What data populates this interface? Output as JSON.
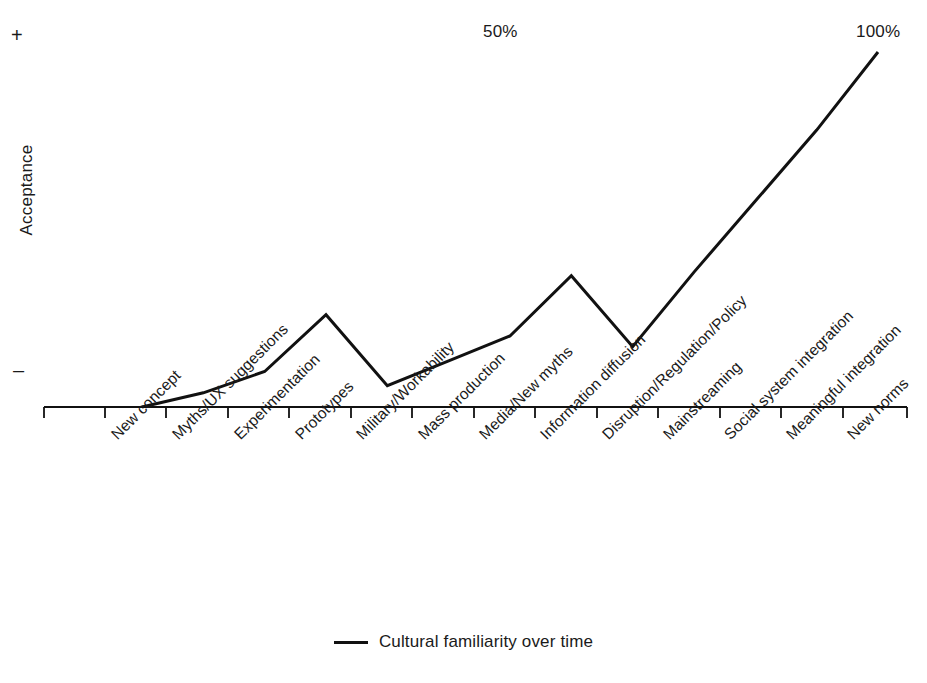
{
  "axis": {
    "y_title": "Acceptance",
    "y_high_marker": "+",
    "y_low_marker": "–"
  },
  "annotations": {
    "midpoint": "50%",
    "endpoint": "100%"
  },
  "legend": {
    "swatch": "line-swatch",
    "label": "Cultural familiarity over time"
  },
  "chart_data": {
    "type": "line",
    "title": "",
    "xlabel": "",
    "ylabel": "Acceptance",
    "grid": false,
    "legend_position": "bottom-center",
    "ylim": [
      0,
      100
    ],
    "ytick_labels": [
      "–",
      "+"
    ],
    "annotations": [
      {
        "text": "50%",
        "x_category": "Media/New myths",
        "position": "top"
      },
      {
        "text": "100%",
        "x_category": "New norms",
        "position": "top"
      }
    ],
    "categories": [
      "New concept",
      "Myths/UX suggestions",
      "Experimentation",
      "Prototypes",
      "Military/Workability",
      "Mass production",
      "Media/New myths",
      "Information diffusion",
      "Disruption/Regulation/Policy",
      "Mainstreaming",
      "Social system integration",
      "Meaningful integration",
      "New norms"
    ],
    "series": [
      {
        "name": "Cultural familiarity over time",
        "color": "#111111",
        "values": [
          0,
          4,
          10,
          26,
          6,
          13,
          20,
          37,
          17,
          38,
          58,
          78,
          100
        ]
      }
    ]
  }
}
